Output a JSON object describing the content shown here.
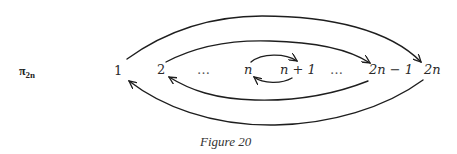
{
  "diagram": {
    "permutation_label": {
      "symbol": "π",
      "subscript": "2n"
    },
    "nodes": [
      {
        "id": "1",
        "label": "1"
      },
      {
        "id": "2",
        "label": "2"
      },
      {
        "id": "dots1",
        "label": "…"
      },
      {
        "id": "n",
        "label": "n"
      },
      {
        "id": "n+1",
        "label": "n + 1"
      },
      {
        "id": "dots2",
        "label": "…"
      },
      {
        "id": "2n-1",
        "label": "2n − 1"
      },
      {
        "id": "2n",
        "label": "2n"
      }
    ],
    "edges": [
      {
        "from": "1",
        "to": "2n",
        "position": "outer-top"
      },
      {
        "from": "2",
        "to": "2n-1",
        "position": "inner-top"
      },
      {
        "from": "n",
        "to": "n+1",
        "position": "small-top"
      },
      {
        "from": "n+1",
        "to": "n",
        "position": "small-bottom"
      },
      {
        "from": "2n-1",
        "to": "2",
        "position": "inner-bottom"
      },
      {
        "from": "2n",
        "to": "1",
        "position": "outer-bottom"
      }
    ],
    "caption": "Figure 20"
  }
}
